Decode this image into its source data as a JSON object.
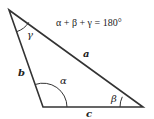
{
  "diagram": {
    "formula": "α + β + γ = 180°",
    "stroke_color": "#333333",
    "vertices": {
      "top": [
        9,
        10
      ],
      "bottom_left": [
        43,
        107
      ],
      "right": [
        143,
        107
      ]
    },
    "sides": [
      {
        "name": "a",
        "label": "a",
        "from": "top",
        "to": "right"
      },
      {
        "name": "b",
        "label": "b",
        "from": "top",
        "to": "bottom_left"
      },
      {
        "name": "c",
        "label": "c",
        "from": "bottom_left",
        "to": "right"
      }
    ],
    "angles": [
      {
        "name": "alpha",
        "label": "α",
        "vertex": "bottom_left"
      },
      {
        "name": "beta",
        "label": "β",
        "vertex": "right"
      },
      {
        "name": "gamma",
        "label": "γ",
        "vertex": "top"
      }
    ]
  }
}
